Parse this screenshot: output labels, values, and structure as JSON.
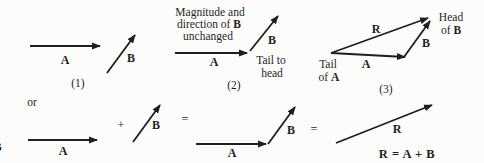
{
  "colors": {
    "background": "#fcfcfa",
    "ink": "#1e1e1e"
  },
  "panel1": {
    "vector_a_label": "A",
    "vector_b_label": "B",
    "caption": "(1)"
  },
  "panel2": {
    "annotation_line1": "Magnitude and",
    "annotation_line2_text": "direction of ",
    "annotation_line2_vector": "B",
    "annotation_line3": "unchanged",
    "vector_a_label": "A",
    "vector_b_label": "B",
    "tail_to_head_line1": "Tail to",
    "tail_to_head_line2": "head",
    "caption": "(2)"
  },
  "panel3": {
    "vector_r_label": "R",
    "vector_a_label": "A",
    "vector_b_label": "B",
    "head_line1": "Head",
    "head_line2_text": "of ",
    "head_line2_vector": "B",
    "tail_line1": "Tail",
    "tail_line2_text": "of ",
    "tail_line2_vector": "A",
    "caption": "(3)"
  },
  "equation_row": {
    "or_label": "or",
    "vector_a_first_label": "A",
    "plus_sign": "+",
    "vector_b_first_label": "B",
    "equals_sign_first": "=",
    "vector_a_second_label": "A",
    "vector_b_second_label": "B",
    "equals_sign_second": "=",
    "vector_r_label": "R",
    "result_equation": "R = A + B"
  },
  "edge_fragment": "B"
}
